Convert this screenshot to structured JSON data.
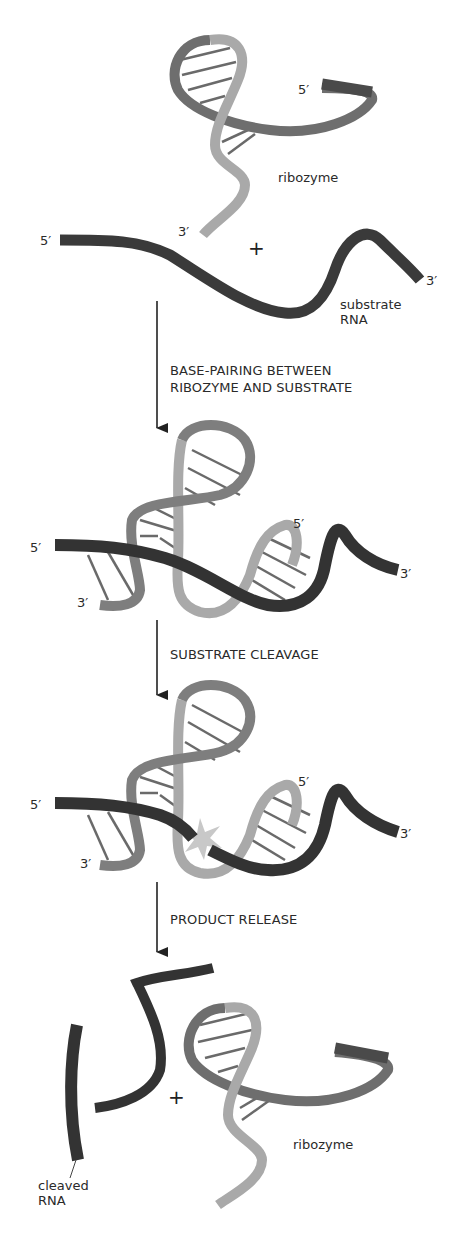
{
  "colors": {
    "substrate": "#3a3a3a",
    "ribozyme_dark": "#6e6e6e",
    "ribozyme_light": "#a9a9a9",
    "base_pair": "#6a6a6a",
    "cleavage_star": "#c8c8c8",
    "arrow": "#222222"
  },
  "stage1": {
    "ribozyme_5prime": "5′",
    "ribozyme_3prime": "3′",
    "ribozyme_label": "ribozyme",
    "plus": "+",
    "substrate_5prime": "5′",
    "substrate_3prime": "3′",
    "substrate_label_line1": "substrate",
    "substrate_label_line2": "RNA"
  },
  "steps": [
    {
      "line1": "BASE-PAIRING BETWEEN",
      "line2": "RIBOZYME AND SUBSTRATE"
    },
    {
      "line1": "SUBSTRATE CLEAVAGE",
      "line2": ""
    },
    {
      "line1": "PRODUCT RELEASE",
      "line2": ""
    }
  ],
  "stage2": {
    "substrate_5prime": "5′",
    "substrate_3prime": "3′",
    "ribozyme_5prime": "5′",
    "ribozyme_3prime": "3′"
  },
  "stage3": {
    "substrate_5prime": "5′",
    "substrate_3prime": "3′",
    "ribozyme_5prime": "5′",
    "ribozyme_3prime": "3′"
  },
  "stage4": {
    "plus": "+",
    "ribozyme_label": "ribozyme",
    "cleaved_label_line1": "cleaved",
    "cleaved_label_line2": "RNA"
  }
}
